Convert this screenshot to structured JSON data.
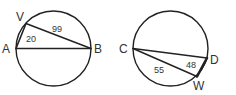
{
  "figures": [
    {
      "name": "circle-1",
      "circle": {
        "cx": 53.5,
        "cy": 48.5,
        "r": 37.5
      },
      "points": [
        {
          "id": "A",
          "label": "A",
          "x": 16,
          "y": 48.5,
          "lx": 2,
          "ly": 53
        },
        {
          "id": "V",
          "label": "V",
          "x": 26,
          "y": 23.5,
          "lx": 16,
          "ly": 21
        },
        {
          "id": "B",
          "label": "B",
          "x": 91,
          "y": 48.5,
          "lx": 94,
          "ly": 53
        }
      ],
      "segments": [
        {
          "from": "A",
          "to": "V",
          "width": 1.6
        },
        {
          "from": "V",
          "to": "B",
          "width": 1.4
        },
        {
          "from": "A",
          "to": "B",
          "width": 1.4
        }
      ],
      "measures": [
        {
          "text": "20",
          "x": 26,
          "y": 42
        },
        {
          "text": "99",
          "x": 52,
          "y": 32
        }
      ]
    },
    {
      "name": "circle-2",
      "circle": {
        "cx": 170.5,
        "cy": 48.5,
        "r": 37.5
      },
      "points": [
        {
          "id": "C",
          "label": "C",
          "x": 133,
          "y": 48.5,
          "lx": 119,
          "ly": 53
        },
        {
          "id": "D",
          "label": "D",
          "x": 207,
          "y": 58,
          "lx": 210,
          "ly": 64
        },
        {
          "id": "W",
          "label": "W",
          "x": 197,
          "y": 76.5,
          "lx": 193,
          "ly": 90
        }
      ],
      "segments": [
        {
          "from": "C",
          "to": "D",
          "width": 1.4
        },
        {
          "from": "C",
          "to": "W",
          "width": 1.4
        },
        {
          "from": "D",
          "to": "W",
          "width": 2.6
        }
      ],
      "measures": [
        {
          "text": "55",
          "x": 154,
          "y": 73
        },
        {
          "text": "48",
          "x": 186,
          "y": 68
        }
      ]
    }
  ],
  "style": {
    "stroke": "#222222",
    "label_color": "#333333"
  }
}
